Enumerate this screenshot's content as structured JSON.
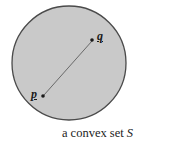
{
  "figure": {
    "type": "geometric-diagram",
    "caption_prefix": "a convex set",
    "set_name": "S",
    "background_color": "#ffffff",
    "shape": {
      "name": "convex-set-disc",
      "kind": "circle",
      "center_x": 69,
      "center_y": 63,
      "radius": 57,
      "fill_color": "#c9c9c9",
      "stroke_color": "#4a4a4a",
      "stroke_width": 1.3
    },
    "points": [
      {
        "id": "p",
        "label": "p",
        "dot_x": 43,
        "dot_y": 96,
        "dot_radius": 1.8,
        "color": "#1a1a1a"
      },
      {
        "id": "q",
        "label": "q",
        "dot_x": 92,
        "dot_y": 40,
        "dot_radius": 1.8,
        "color": "#1a1a1a"
      }
    ],
    "segment": {
      "name": "segment-pq",
      "x1": 44,
      "y1": 95,
      "x2": 92,
      "y2": 41,
      "stroke_color": "#5e5e5e",
      "stroke_width": 0.9
    }
  }
}
